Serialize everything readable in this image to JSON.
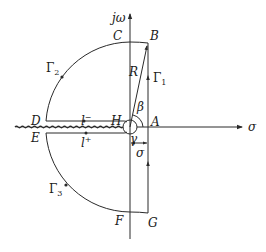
{
  "figure": {
    "type": "contour-integration-diagram",
    "axes": {
      "horizontal_label": "σ",
      "vertical_label": "jω"
    },
    "points": {
      "A": "A",
      "B": "B",
      "C": "C",
      "D": "D",
      "E": "E",
      "F": "F",
      "G": "G",
      "H": "H"
    },
    "contour_labels": {
      "gamma1": "Γ",
      "gamma1_sub": "1",
      "gamma2": "Γ",
      "gamma2_sub": "2",
      "gamma3": "Γ",
      "gamma3_sub": "3",
      "l_minus": "l",
      "l_minus_sup": "−",
      "l_plus": "l",
      "l_plus_sup": "+"
    },
    "annotations": {
      "radius": "R",
      "angle_beta": "β",
      "angle_gamma": "γ",
      "offset_sigma": "σ"
    },
    "colors": {
      "stroke": "#2a2a2a",
      "text": "#1a1a1a",
      "background": "#ffffff"
    }
  }
}
